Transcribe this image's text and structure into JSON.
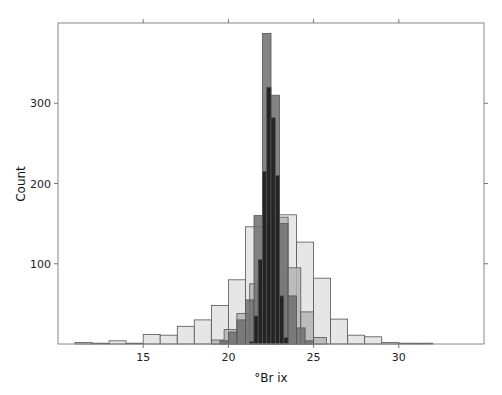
{
  "chart_data": {
    "type": "bar",
    "subtype": "overlapping-histogram",
    "title": "",
    "xlabel": "°Br ix",
    "ylabel": "Count",
    "xlim": [
      10,
      35
    ],
    "ylim": [
      0,
      400
    ],
    "x_ticks": [
      15,
      20,
      25,
      30
    ],
    "y_ticks": [
      100,
      200,
      300
    ],
    "grid": false,
    "legend": null,
    "series": [
      {
        "name": "series-1-light",
        "color": "#e6e6e6",
        "bin_width": 1.0,
        "bins": [
          {
            "x0": 11,
            "count": 2
          },
          {
            "x0": 12,
            "count": 1
          },
          {
            "x0": 13,
            "count": 4
          },
          {
            "x0": 14,
            "count": 1
          },
          {
            "x0": 15,
            "count": 12
          },
          {
            "x0": 16,
            "count": 11
          },
          {
            "x0": 17,
            "count": 22
          },
          {
            "x0": 18,
            "count": 30
          },
          {
            "x0": 19,
            "count": 48
          },
          {
            "x0": 20,
            "count": 80
          },
          {
            "x0": 21,
            "count": 146
          },
          {
            "x0": 22,
            "count": 160
          },
          {
            "x0": 23,
            "count": 161
          },
          {
            "x0": 24,
            "count": 127
          },
          {
            "x0": 25,
            "count": 82
          },
          {
            "x0": 26,
            "count": 31
          },
          {
            "x0": 27,
            "count": 11
          },
          {
            "x0": 28,
            "count": 9
          },
          {
            "x0": 29,
            "count": 2
          },
          {
            "x0": 30,
            "count": 1
          },
          {
            "x0": 31,
            "count": 1
          }
        ]
      },
      {
        "name": "series-2-medium",
        "color": "#b4b4b4",
        "bin_width": 0.75,
        "bins": [
          {
            "x0": 19.0,
            "count": 5
          },
          {
            "x0": 19.75,
            "count": 18
          },
          {
            "x0": 20.5,
            "count": 38
          },
          {
            "x0": 21.25,
            "count": 75
          },
          {
            "x0": 22.0,
            "count": 150
          },
          {
            "x0": 22.75,
            "count": 158
          },
          {
            "x0": 23.5,
            "count": 95
          },
          {
            "x0": 24.25,
            "count": 40
          },
          {
            "x0": 25.0,
            "count": 8
          }
        ]
      },
      {
        "name": "series-3-dark",
        "color": "#6e6e6e",
        "bin_width": 0.5,
        "bins": [
          {
            "x0": 19.5,
            "count": 4
          },
          {
            "x0": 20.0,
            "count": 15
          },
          {
            "x0": 20.5,
            "count": 30
          },
          {
            "x0": 21.0,
            "count": 55
          },
          {
            "x0": 21.5,
            "count": 160
          },
          {
            "x0": 22.0,
            "count": 387
          },
          {
            "x0": 22.5,
            "count": 310
          },
          {
            "x0": 23.0,
            "count": 150
          },
          {
            "x0": 23.5,
            "count": 60
          },
          {
            "x0": 24.0,
            "count": 20
          },
          {
            "x0": 24.5,
            "count": 4
          }
        ]
      },
      {
        "name": "series-4-black",
        "color": "#141414",
        "bin_width": 0.25,
        "bins": [
          {
            "x0": 21.25,
            "count": 3
          },
          {
            "x0": 21.5,
            "count": 35
          },
          {
            "x0": 21.75,
            "count": 105
          },
          {
            "x0": 22.0,
            "count": 215
          },
          {
            "x0": 22.25,
            "count": 320
          },
          {
            "x0": 22.5,
            "count": 282
          },
          {
            "x0": 22.75,
            "count": 210
          },
          {
            "x0": 23.0,
            "count": 60
          },
          {
            "x0": 23.25,
            "count": 8
          }
        ]
      }
    ]
  },
  "layout": {
    "plot_left": 58,
    "plot_right": 484,
    "plot_top": 23,
    "plot_bottom": 344
  }
}
